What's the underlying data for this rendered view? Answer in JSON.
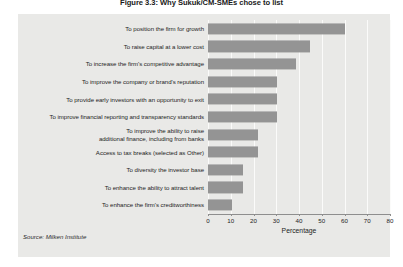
{
  "figure": {
    "title": "Figure 3.3: Why Sukuk/CM-SMEs chose to list",
    "source": "Source: Milken Institute"
  },
  "chart_data": {
    "type": "bar",
    "orientation": "horizontal",
    "title": "Figure 3.3: Why Sukuk/CM-SMEs chose to list",
    "xlabel": "Percentage",
    "ylabel": "",
    "xlim": [
      0,
      80
    ],
    "xticks": [
      0,
      10,
      20,
      30,
      40,
      50,
      60,
      70,
      80
    ],
    "xtick_labels": [
      "0",
      "10",
      "20",
      "30",
      "40",
      "50",
      "60",
      "70",
      "80"
    ],
    "grid": true,
    "legend": "none",
    "bar_color": "#949494",
    "panel_color": "#e9e9e7",
    "gridline_color": "#fbfbfa",
    "categories": [
      "To position the firm for growth",
      "To raise capital at a lower cost",
      "To increase the firm's competitive advantage",
      "To improve the company or brand's reputation",
      "To provide early investors with an opportunity to exit",
      "To improve financial reporting and transparency standards",
      "To improve the ability to raise additional finance, including from banks",
      "Access to tax breaks (selected as Other)",
      "To diversity the investor base",
      "To enhance the ability to attract talent",
      "To enhance the firm's creditworthiness"
    ],
    "category_lines": [
      [
        "To position the firm for growth"
      ],
      [
        "To raise capital at a lower cost"
      ],
      [
        "To increase the firm's competitive advantage"
      ],
      [
        "To improve the company or brand's reputation"
      ],
      [
        "To provide early investors with an opportunity to exit"
      ],
      [
        "To improve financial reporting and transparency standards"
      ],
      [
        "To improve the ability to raise",
        "additional finance, including from banks"
      ],
      [
        "Access to tax breaks (selected as Other)"
      ],
      [
        "To diversity the investor base"
      ],
      [
        "To enhance the ability to attract talent"
      ],
      [
        "To enhance the firm's creditworthiness"
      ]
    ],
    "values": [
      60,
      45,
      38.5,
      30.5,
      30.5,
      30.5,
      22,
      22,
      15.5,
      15.5,
      10.5
    ]
  }
}
